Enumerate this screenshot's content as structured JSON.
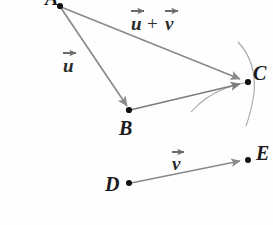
{
  "figure": {
    "background_color": "#fefefe",
    "line_color": "#8a8a8a",
    "arc_color": "#9a9a9a",
    "point_color": "#111111",
    "label_color": "#1a1a1a"
  },
  "points": [
    {
      "id": "A",
      "label": "A",
      "x": 60,
      "y": 6,
      "label_x": 46,
      "label_y": 4
    },
    {
      "id": "B",
      "label": "B",
      "x": 129,
      "y": 110,
      "label_x": 121,
      "label_y": 134
    },
    {
      "id": "C",
      "label": "C",
      "x": 248,
      "y": 82,
      "label_x": 252,
      "label_y": 78
    },
    {
      "id": "D",
      "label": "D",
      "x": 129,
      "y": 183,
      "label_x": 106,
      "label_y": 190
    },
    {
      "id": "E",
      "label": "E",
      "x": 248,
      "y": 160,
      "label_x": 255,
      "label_y": 158
    }
  ],
  "vectors": [
    {
      "id": "u",
      "from": "A",
      "to": "B",
      "label": "u",
      "accent": "vector-arrow",
      "label_x": 66,
      "label_y": 70
    },
    {
      "id": "u_plus_v",
      "from": "A",
      "to": "C",
      "label": "u + v",
      "accent": "vector-arrow",
      "label_x": 130,
      "label_y": 26
    },
    {
      "id": "bc",
      "from": "B",
      "to": "C",
      "label": "",
      "accent": "vector-arrow",
      "label_x": 0,
      "label_y": 0
    },
    {
      "id": "v",
      "from": "D",
      "to": "E",
      "label": "v",
      "accent": "vector-arrow",
      "label_x": 174,
      "label_y": 168
    }
  ],
  "labels": {
    "u": "u",
    "v": "v",
    "plus": "+",
    "sum_expression": "u + v",
    "A": "A",
    "B": "B",
    "C": "C",
    "D": "D",
    "E": "E"
  },
  "arcs": [
    {
      "id": "large-arc-through-C",
      "description": "compass arc centered near B passing through C"
    },
    {
      "id": "small-arc-left-of-C",
      "description": "compass arc centered near E passing through C"
    }
  ]
}
